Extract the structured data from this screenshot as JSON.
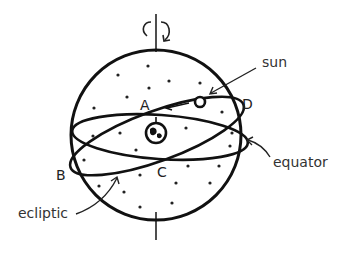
{
  "diagram": {
    "points": {
      "a": "A",
      "b": "B",
      "c": "C",
      "d": "D"
    },
    "labels": {
      "sun": "sun",
      "equator": "equator",
      "ecliptic": "ecliptic"
    },
    "colors": {
      "stroke": "#111111",
      "text": "#333333",
      "background": "#ffffff"
    }
  }
}
